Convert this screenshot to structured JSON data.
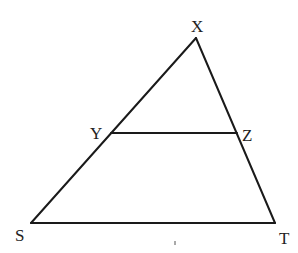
{
  "diagram": {
    "type": "triangle-with-parallel-segment",
    "stroke_color": "#1a1a1a",
    "label_color": "#222222",
    "vertices": {
      "X": {
        "x": 196,
        "y": 38
      },
      "Y": {
        "x": 111,
        "y": 133
      },
      "Z": {
        "x": 237,
        "y": 133
      },
      "S": {
        "x": 31,
        "y": 223
      },
      "T": {
        "x": 275,
        "y": 223
      }
    },
    "labels": {
      "X": {
        "text": "X",
        "x": 191,
        "y": 32
      },
      "Y": {
        "text": "Y",
        "x": 90,
        "y": 139
      },
      "Z": {
        "text": "Z",
        "x": 242,
        "y": 141
      },
      "S": {
        "text": "S",
        "x": 15,
        "y": 241
      },
      "T": {
        "text": "T",
        "x": 279,
        "y": 244
      }
    },
    "segments": [
      {
        "name": "XS",
        "from": "X",
        "to": "S"
      },
      {
        "name": "XT",
        "from": "X",
        "to": "T"
      },
      {
        "name": "ST",
        "from": "S",
        "to": "T"
      },
      {
        "name": "YZ",
        "from": "Y",
        "to": "Z"
      }
    ],
    "tick_mark": {
      "x": 175,
      "y1": 241,
      "y2": 245
    }
  }
}
